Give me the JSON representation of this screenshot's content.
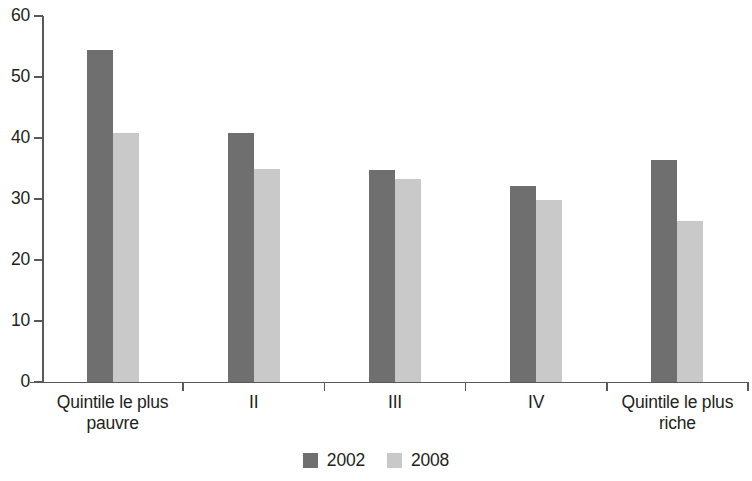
{
  "chart_data": {
    "type": "bar",
    "title": "",
    "subtitle": "",
    "xlabel": "",
    "ylabel": "",
    "categories": [
      "Quintile le plus pauvre",
      "II",
      "III",
      "IV",
      "Quintile le plus riche"
    ],
    "series": [
      {
        "name": "2002",
        "color": "#6f6f6f",
        "values": [
          54.5,
          40.8,
          34.8,
          32.2,
          36.4
        ]
      },
      {
        "name": "2008",
        "color": "#c9c9c9",
        "values": [
          40.8,
          35.0,
          33.2,
          29.8,
          26.4
        ]
      }
    ],
    "ylim": [
      0,
      60
    ],
    "ytick_labels": [
      "0",
      "10",
      "20",
      "30",
      "40",
      "50",
      "60"
    ],
    "ytick_values": [
      0,
      10,
      20,
      30,
      40,
      50,
      60
    ],
    "grid": false,
    "legend_position": "bottom",
    "legend": [
      "2002",
      "2008"
    ]
  }
}
